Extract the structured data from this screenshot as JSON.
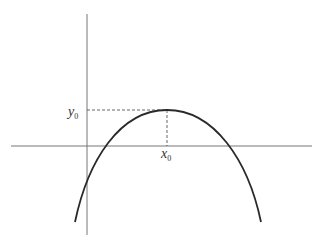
{
  "diagram": {
    "type": "concave-down parabola with marked maximum point",
    "labels": {
      "x0_main": "x",
      "x0_sub": "0",
      "y0_main": "y",
      "y0_sub": "0"
    },
    "colors": {
      "axis": "#777777",
      "curve": "#2a2a2a",
      "guide": "#555555",
      "text": "#333333"
    },
    "axes": {
      "x_axis": {
        "x1": 11,
        "x2": 312,
        "y": 146
      },
      "y_axis": {
        "x": 87,
        "y1": 14,
        "y2": 235
      }
    },
    "curve": {
      "left_end": [
        75,
        222
      ],
      "y_axis_crossing": [
        87,
        183
      ],
      "left_x_axis_crossing": [
        106,
        146
      ],
      "vertex": [
        167,
        110
      ],
      "right_x_axis_crossing": [
        228,
        146
      ],
      "right_end": [
        261,
        222
      ]
    },
    "guides": {
      "horizontal": {
        "from": [
          87,
          110
        ],
        "to": [
          167,
          110
        ],
        "style": "dashed"
      },
      "vertical": {
        "from": [
          167,
          110
        ],
        "to": [
          167,
          146
        ],
        "style": "dashed"
      }
    }
  }
}
